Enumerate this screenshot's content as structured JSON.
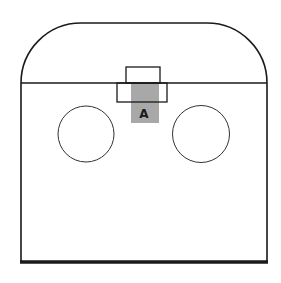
{
  "diagram": {
    "labels": {
      "component_a": "A"
    },
    "colors": {
      "stroke": "#1a1a1a",
      "highlight_fill": "#a8a8a8",
      "background": "#ffffff"
    },
    "elements": [
      {
        "name": "outer-enclosure",
        "shape": "rounded-top-rectangle"
      },
      {
        "name": "divider-line",
        "shape": "horizontal-line"
      },
      {
        "name": "left-circle",
        "shape": "circle"
      },
      {
        "name": "right-circle",
        "shape": "circle"
      },
      {
        "name": "upper-small-box",
        "shape": "rectangle"
      },
      {
        "name": "lower-wide-box",
        "shape": "rectangle"
      },
      {
        "name": "shaded-region-a",
        "shape": "rectangle",
        "label": "A"
      }
    ]
  }
}
